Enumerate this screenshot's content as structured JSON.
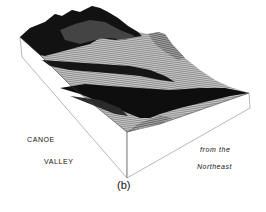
{
  "figure": {
    "panel_label": "(b)",
    "title_line1": "CANOE",
    "title_line2": "VALLEY",
    "view_line1": "from the",
    "view_line2": "Northeast",
    "type": "3D terrain block diagram",
    "colors": {
      "background": "#ffffff",
      "terrain_dark": "#111111",
      "terrain_mid": "#7a7a7a",
      "terrain_light": "#bdbdbd",
      "block_edge": "#9a9a9a"
    }
  }
}
